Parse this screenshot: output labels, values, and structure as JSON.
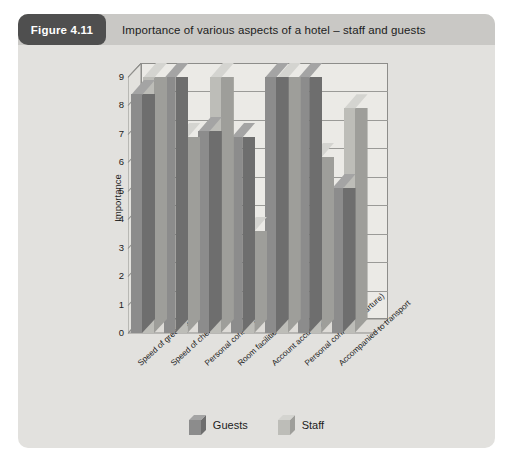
{
  "figure": {
    "badge": "Figure 4.11",
    "caption": "Importance of various aspects of a hotel – staff and guests"
  },
  "colors": {
    "card_background": "#e2e1de",
    "header_background": "#c9c8c5",
    "badge_background": "#4f4f4f",
    "plot_background": "#ebeae6",
    "guests_front": "#8c8c8c",
    "guests_side": "#6e6e6e",
    "guests_top": "#a4a4a4",
    "staff_front": "#bdbdb8",
    "staff_side": "#9e9e9a",
    "staff_top": "#d4d4d0",
    "axis": "#8d8d8a"
  },
  "chart_data": {
    "type": "bar",
    "title": "Importance of various aspects of a hotel – staff and guests",
    "xlabel": "",
    "ylabel": "Importance",
    "ylim": [
      0,
      9
    ],
    "yticks": [
      0,
      1,
      2,
      3,
      4,
      5,
      6,
      7,
      8,
      9
    ],
    "grid": true,
    "legend_position": "bottom",
    "three_d": true,
    "categories": [
      "Speed of greeting",
      "Speed of check-in",
      "Personal contact (arrival)",
      "Room facilities explained",
      "Account accuracy",
      "Personal contact (departure)",
      "Accompanied to transport"
    ],
    "series": [
      {
        "name": "Guests",
        "values": [
          8.4,
          9.0,
          7.1,
          6.9,
          9.0,
          9.0,
          5.1
        ]
      },
      {
        "name": "Staff",
        "values": [
          9.0,
          6.9,
          9.0,
          3.6,
          9.0,
          6.2,
          7.9
        ]
      }
    ]
  },
  "legend": {
    "items": [
      {
        "label": "Guests"
      },
      {
        "label": "Staff"
      }
    ]
  }
}
